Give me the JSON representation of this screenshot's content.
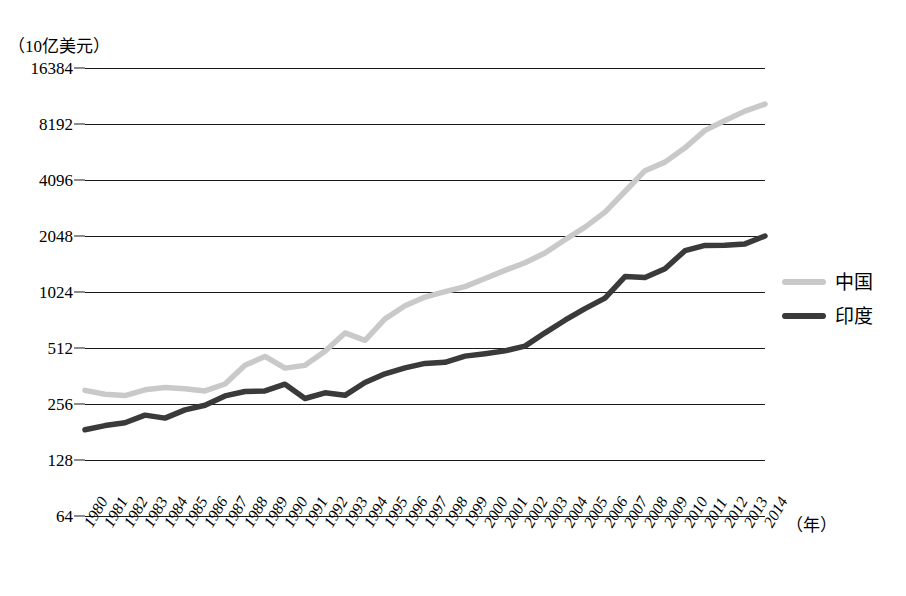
{
  "axes": {
    "y_unit_label": "（10亿美元）",
    "x_unit_label": "（年）",
    "y_ticks": [
      64,
      128,
      256,
      512,
      1024,
      2048,
      4096,
      8192,
      16384
    ],
    "y_scale": "log2",
    "y_min": 64,
    "y_max": 16384,
    "x_ticks": [
      "1980",
      "1981",
      "1982",
      "1983",
      "1984",
      "1985",
      "1986",
      "1987",
      "1988",
      "1989",
      "1990",
      "1991",
      "1992",
      "1993",
      "1994",
      "1995",
      "1996",
      "1997",
      "1998",
      "1999",
      "2000",
      "2001",
      "2002",
      "2003",
      "2004",
      "2005",
      "2006",
      "2007",
      "2008",
      "2009",
      "2010",
      "2011",
      "2012",
      "2013",
      "2014"
    ]
  },
  "legend": {
    "position": "right",
    "entries": [
      {
        "label": "中国",
        "color": "#c9c9c9"
      },
      {
        "label": "印度",
        "color": "#3a3a3a"
      }
    ]
  },
  "colors": {
    "china_line": "#c9c9c9",
    "india_line": "#3a3a3a",
    "gridline": "#1b1b1b",
    "background": "#ffffff"
  },
  "chart_data": {
    "type": "line",
    "title": "",
    "xlabel": "（年）",
    "ylabel": "（10亿美元）",
    "yscale": "log2",
    "ylim": [
      64,
      16384
    ],
    "grid": true,
    "legend_position": "right",
    "x": [
      1980,
      1981,
      1982,
      1983,
      1984,
      1985,
      1986,
      1987,
      1988,
      1989,
      1990,
      1991,
      1992,
      1993,
      1994,
      1995,
      1996,
      1997,
      1998,
      1999,
      2000,
      2001,
      2002,
      2003,
      2004,
      2005,
      2006,
      2007,
      2008,
      2009,
      2010,
      2011,
      2012,
      2013,
      2014
    ],
    "series": [
      {
        "name": "中国",
        "color": "#c9c9c9",
        "values": [
          303,
          289,
          284,
          305,
          314,
          309,
          301,
          328,
          413,
          461,
          399,
          413,
          492,
          617,
          563,
          734,
          863,
          962,
          1029,
          1094,
          1211,
          1339,
          1471,
          1660,
          1955,
          2286,
          2752,
          3552,
          4598,
          5110,
          6101,
          7573,
          8561,
          9607,
          10482
        ]
      },
      {
        "name": "印度",
        "color": "#3a3a3a",
        "values": [
          186,
          196,
          203,
          223,
          215,
          238,
          252,
          283,
          299,
          301,
          327,
          274,
          294,
          285,
          334,
          372,
          400,
          423,
          429,
          463,
          477,
          494,
          524,
          618,
          722,
          834,
          949,
          1239,
          1224,
          1365,
          1708,
          1823,
          1828,
          1857,
          2048
        ]
      }
    ]
  }
}
